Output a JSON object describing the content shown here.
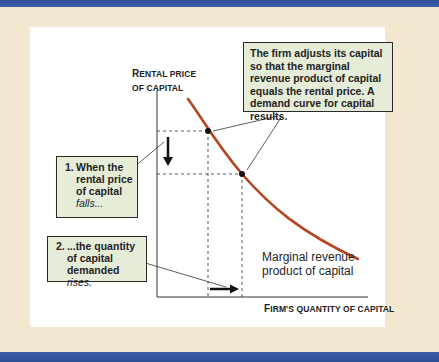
{
  "figure": {
    "y_axis_label_first": "R",
    "y_axis_label_rest": "ENTAL PRICE",
    "y_axis_label_line2": "OF CAPITAL",
    "x_axis_label_first": "F",
    "x_axis_label_rest": "IRM'S QUANTITY OF CAPITAL",
    "curve_label_line1": "Marginal revenue",
    "curve_label_line2": "product of capital",
    "callout_top": "The firm adjusts its capital so that the marginal revenue product of capital equals the rental price. A demand curve for capital results.",
    "callout_1_number": "1.",
    "callout_1_text": "When the rental price of capital",
    "callout_1_italic": "falls...",
    "callout_2_number": "2.",
    "callout_2_text": "...the quantity of capital demanded",
    "callout_2_italic": "rises.",
    "colors": {
      "frame_blue": "#2c4c94",
      "background": "#f1e8cf",
      "curve": "#b5461f",
      "callout_fill": "#e5ecd8"
    }
  }
}
